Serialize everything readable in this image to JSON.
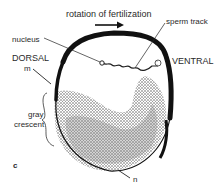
{
  "diagram": {
    "panel_label": "c",
    "labels": {
      "rotation": "rotation of fertilization",
      "sperm_track": "sperm track",
      "nucleus": "nucleus",
      "dorsal": "DORSAL",
      "ventral": "VENTRAL",
      "m": "m",
      "gray": "gray",
      "crescent": "crescent",
      "n": "n"
    },
    "icons": {
      "rotation_arrow": "right-arrow-icon"
    }
  }
}
